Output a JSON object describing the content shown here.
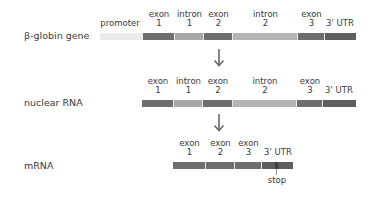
{
  "colors": {
    "promoter": "#e9e9e9",
    "exon": "#6f6f6f",
    "intron": "#a9a9a9",
    "utr": "#5f5f5f",
    "text": "#3a3a3a"
  },
  "rows": {
    "gene": {
      "label": "β-globin gene",
      "segments": [
        {
          "type": "promoter",
          "line1": "promoter",
          "line2": ""
        },
        {
          "type": "exon",
          "line1": "exon",
          "line2": "1"
        },
        {
          "type": "intron",
          "line1": "intron",
          "line2": "1"
        },
        {
          "type": "exon",
          "line1": "exon",
          "line2": "2"
        },
        {
          "type": "intron",
          "line1": "intron",
          "line2": "2"
        },
        {
          "type": "exon",
          "line1": "exon",
          "line2": "3"
        },
        {
          "type": "utr",
          "line1": "",
          "line2": "3' UTR"
        }
      ]
    },
    "nuclear_rna": {
      "label": "nuclear RNA",
      "segments": [
        {
          "type": "exon",
          "line1": "exon",
          "line2": "1"
        },
        {
          "type": "intron",
          "line1": "intron",
          "line2": "1"
        },
        {
          "type": "exon",
          "line1": "exon",
          "line2": "2"
        },
        {
          "type": "intron",
          "line1": "intron",
          "line2": "2"
        },
        {
          "type": "exon",
          "line1": "exon",
          "line2": "3"
        },
        {
          "type": "utr",
          "line1": "",
          "line2": "3' UTR"
        }
      ]
    },
    "mrna": {
      "label": "mRNA",
      "segments": [
        {
          "type": "exon",
          "line1": "exon",
          "line2": "1"
        },
        {
          "type": "exon",
          "line1": "exon",
          "line2": "2"
        },
        {
          "type": "exon",
          "line1": "exon",
          "line2": "3"
        },
        {
          "type": "utr",
          "line1": "",
          "line2": "3' UTR"
        }
      ],
      "stop_label": "stop"
    }
  }
}
